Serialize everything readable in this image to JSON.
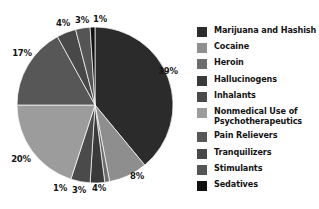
{
  "chart_data": {
    "type": "pie",
    "title": "",
    "subtitle": "",
    "xlabel": "",
    "ylabel": "",
    "grid": false,
    "legend_position": "right",
    "units": "percent",
    "categories": [
      "Marijuana and Hashish",
      "Cocaine",
      "Heroin",
      "Hallucinogens",
      "Inhalants",
      "Nonmedical Use of Psychotherapeutics",
      "Pain Relievers",
      "Tranquilizers",
      "Stimulants",
      "Sedatives"
    ],
    "values": [
      39,
      8,
      1,
      3,
      4,
      20,
      17,
      4,
      3,
      1
    ],
    "labels": [
      "39%",
      "8%",
      "1%",
      "3%",
      "4%",
      "20%",
      "17%",
      "4%",
      "3%",
      "1%"
    ],
    "colors": [
      "#2b2b2b",
      "#8e8e8e",
      "#6d6d6d",
      "#3a3a3a",
      "#4a4a4a",
      "#9c9c9c",
      "#575757",
      "#484848",
      "#555555",
      "#101010"
    ],
    "start_angle_deg": 0,
    "direction": "clockwise"
  },
  "legend": {
    "items": [
      {
        "label": "Marijuana and Hashish",
        "color": "#2b2b2b"
      },
      {
        "label": "Cocaine",
        "color": "#8e8e8e"
      },
      {
        "label": "Heroin",
        "color": "#6d6d6d"
      },
      {
        "label": "Hallucinogens",
        "color": "#3a3a3a"
      },
      {
        "label": "Inhalants",
        "color": "#4a4a4a"
      },
      {
        "label": "Nonmedical Use of\nPsychotherapeutics",
        "color": "#9c9c9c"
      },
      {
        "label": "Pain Relievers",
        "color": "#575757"
      },
      {
        "label": "Tranquilizers",
        "color": "#484848"
      },
      {
        "label": "Stimulants",
        "color": "#555555"
      },
      {
        "label": "Sedatives",
        "color": "#101010"
      }
    ]
  },
  "pie_labels": [
    {
      "text": "39%",
      "x": 168,
      "y": 71
    },
    {
      "text": "8%",
      "x": 137,
      "y": 176
    },
    {
      "text": "4%",
      "x": 99,
      "y": 188
    },
    {
      "text": "3%",
      "x": 79,
      "y": 190
    },
    {
      "text": "1%",
      "x": 60,
      "y": 188
    },
    {
      "text": "20%",
      "x": 21,
      "y": 159
    },
    {
      "text": "17%",
      "x": 22,
      "y": 53
    },
    {
      "text": "4%",
      "x": 63,
      "y": 23
    },
    {
      "text": "3%",
      "x": 82,
      "y": 20
    },
    {
      "text": "1%",
      "x": 100,
      "y": 19
    }
  ],
  "geometry": {
    "cx": 95,
    "cy": 105,
    "r": 78
  }
}
